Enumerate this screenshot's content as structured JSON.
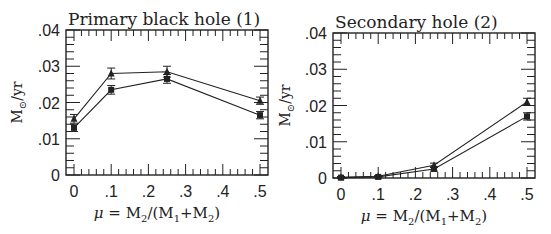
{
  "chart_data": [
    {
      "type": "line",
      "title": "Primary black hole (1)",
      "xlabel": "μ = M₂/(M₁+M₂)",
      "ylabel": "M☉/yr",
      "x": [
        0,
        0.1,
        0.25,
        0.5
      ],
      "xlim": [
        0,
        0.5
      ],
      "ylim": [
        0,
        0.04
      ],
      "xticks": [
        "0",
        ".1",
        ".2",
        ".3",
        ".4",
        ".5"
      ],
      "yticks": [
        "0",
        ".01",
        ".02",
        ".03",
        ".04"
      ],
      "grid": false,
      "series": [
        {
          "name": "triangles",
          "marker": "triangle",
          "values": [
            0.0155,
            0.028,
            0.0285,
            0.0205
          ],
          "errors": [
            0.0012,
            0.0015,
            0.0015,
            0.001
          ]
        },
        {
          "name": "squares",
          "marker": "square",
          "values": [
            0.013,
            0.0235,
            0.0265,
            0.0165
          ],
          "errors": [
            0.001,
            0.0012,
            0.0012,
            0.001
          ]
        }
      ]
    },
    {
      "type": "line",
      "title": "Secondary hole (2)",
      "xlabel": "μ = M₂/(M₁+M₂)",
      "ylabel": "M☉/yr",
      "x": [
        0,
        0.1,
        0.25,
        0.5
      ],
      "xlim": [
        0,
        0.5
      ],
      "ylim": [
        0,
        0.04
      ],
      "xticks": [
        "0",
        ".1",
        ".2",
        ".3",
        ".4",
        ".5"
      ],
      "yticks": [
        "0",
        ".01",
        ".02",
        ".03",
        ".04"
      ],
      "grid": false,
      "series": [
        {
          "name": "triangles",
          "marker": "triangle",
          "values": [
            0.0002,
            0.0005,
            0.0035,
            0.021
          ],
          "errors": [
            0.0002,
            0.0002,
            0.0006,
            0.001
          ]
        },
        {
          "name": "squares",
          "marker": "square",
          "values": [
            0.0001,
            0.0003,
            0.0025,
            0.017
          ],
          "errors": [
            0.0002,
            0.0002,
            0.0006,
            0.001
          ]
        }
      ]
    }
  ],
  "panels": [
    {
      "title": "Primary black hole (1)"
    },
    {
      "title": "Secondary hole (2)"
    }
  ],
  "labels": {
    "mu": "μ",
    "eq": " = M",
    "sub2": "2",
    "mid": "/(M",
    "sub1": "1",
    "plus": "+M",
    "close": ")",
    "ym": "M",
    "ysun": "⊙",
    "yunit": "/yr"
  }
}
